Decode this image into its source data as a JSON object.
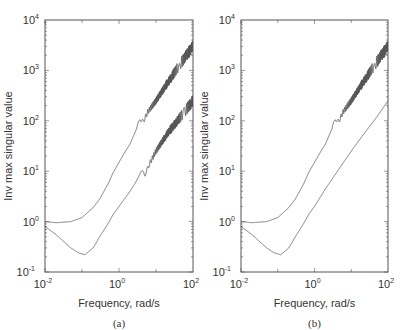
{
  "chart_data": [
    {
      "type": "line",
      "panel": "(a)",
      "xscale": "log",
      "yscale": "log",
      "xlabel": "Frequency, rad/s",
      "ylabel": "Inv max singular value",
      "xlim": [
        0.01,
        100
      ],
      "ylim": [
        0.1,
        10000
      ],
      "xticks": [
        "10^-2",
        "10^0",
        "10^2"
      ],
      "yticks": [
        "10^-1",
        "10^0",
        "10^1",
        "10^2",
        "10^3",
        "10^4"
      ],
      "grid": false,
      "legend": null,
      "series": [
        {
          "name": "upper",
          "x": [
            0.01,
            0.02,
            0.05,
            0.1,
            0.2,
            0.3,
            0.5,
            0.7,
            1.0,
            1.5,
            2.0,
            3.0,
            3.7,
            4.5,
            6,
            10,
            20,
            50,
            100
          ],
          "y": [
            1.0,
            0.95,
            1.0,
            1.2,
            1.9,
            2.8,
            5.5,
            9.5,
            15,
            25,
            35,
            70,
            110,
            95,
            150,
            250,
            550,
            1500,
            3000
          ],
          "oscillates_above_rad_s": 3
        },
        {
          "name": "lower",
          "x": [
            0.01,
            0.02,
            0.05,
            0.08,
            0.12,
            0.2,
            0.3,
            0.5,
            0.7,
            1.0,
            1.5,
            2.0,
            3.0,
            4.0,
            5.0,
            7,
            10,
            20,
            50,
            100
          ],
          "y": [
            0.8,
            0.55,
            0.3,
            0.24,
            0.22,
            0.3,
            0.5,
            0.9,
            1.4,
            2.0,
            3.0,
            4.0,
            6.5,
            10,
            8.5,
            15,
            25,
            55,
            130,
            250
          ],
          "oscillates_above_rad_s": 4
        }
      ]
    },
    {
      "type": "line",
      "panel": "(b)",
      "xscale": "log",
      "yscale": "log",
      "xlabel": "Frequency, rad/s",
      "ylabel": "Inv max singular value",
      "xlim": [
        0.01,
        100
      ],
      "ylim": [
        0.1,
        10000
      ],
      "xticks": [
        "10^-2",
        "10^0",
        "10^2"
      ],
      "yticks": [
        "10^-1",
        "10^0",
        "10^1",
        "10^2",
        "10^3",
        "10^4"
      ],
      "grid": false,
      "legend": null,
      "series": [
        {
          "name": "upper",
          "x": [
            0.01,
            0.02,
            0.05,
            0.1,
            0.2,
            0.3,
            0.5,
            0.7,
            1.0,
            1.5,
            2.0,
            3.0,
            3.7,
            4.5,
            6,
            10,
            20,
            50,
            100
          ],
          "y": [
            1.0,
            0.95,
            1.0,
            1.2,
            1.9,
            2.8,
            5.5,
            9.5,
            15,
            25,
            35,
            70,
            110,
            95,
            150,
            250,
            550,
            1500,
            3000
          ],
          "oscillates_above_rad_s": 3
        },
        {
          "name": "lower",
          "x": [
            0.01,
            0.02,
            0.05,
            0.08,
            0.12,
            0.2,
            0.3,
            0.5,
            0.7,
            1.0,
            2.0,
            5.0,
            10,
            20,
            50,
            100
          ],
          "y": [
            0.8,
            0.55,
            0.3,
            0.24,
            0.22,
            0.3,
            0.5,
            0.9,
            1.4,
            2.0,
            4.5,
            12,
            25,
            50,
            120,
            250
          ],
          "oscillates_above_rad_s": null
        }
      ]
    }
  ],
  "panels": [
    {
      "caption": "(a)",
      "xlabel": "Frequency, rad/s",
      "ylabel": "Inv max singular value"
    },
    {
      "caption": "(b)",
      "xlabel": "Frequency, rad/s",
      "ylabel": "Inv max singular value"
    }
  ],
  "colors": {
    "line": "#555555",
    "axes": "#555555",
    "text": "#333333"
  }
}
